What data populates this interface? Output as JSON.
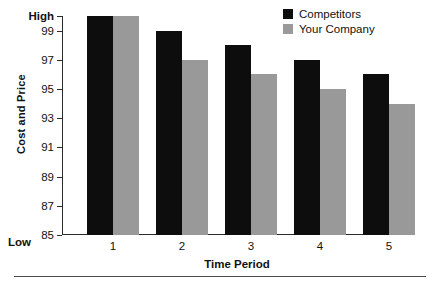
{
  "chart_data": {
    "type": "bar",
    "title": "",
    "subtitle": "",
    "xlabel": "Time Period",
    "ylabel": "Cost and Price",
    "categories": [
      "1",
      "2",
      "3",
      "4",
      "5"
    ],
    "series": [
      {
        "name": "Competitors",
        "color": "#0d0d0d",
        "values": [
          100,
          99,
          98,
          97,
          96
        ]
      },
      {
        "name": "Your Company",
        "color": "#999999",
        "values": [
          100,
          97,
          96,
          95,
          94
        ]
      }
    ],
    "ylim": [
      85,
      100
    ],
    "ytick_values": [
      100,
      99,
      97,
      95,
      93,
      91,
      89,
      87,
      85
    ],
    "ytick_labels": [
      "High",
      "99",
      "97",
      "95",
      "93",
      "91",
      "89",
      "87",
      "85"
    ],
    "y_axis_low_label": "Low",
    "y_axis_high_label": "High",
    "grid": false,
    "legend_position": "top-right"
  },
  "axes": {
    "y_title": "Cost and Price",
    "x_title": "Time Period",
    "low_marker": "Low"
  },
  "legend": {
    "entries": [
      {
        "label": "Competitors",
        "swatch": "black-square"
      },
      {
        "label": "Your Company",
        "swatch": "gray-square"
      }
    ]
  },
  "colors": {
    "competitors": "#0d0d0d",
    "your_company": "#999999",
    "axis": "#2b2b2b",
    "background": "#ffffff",
    "rule": "#4a4a4a"
  }
}
